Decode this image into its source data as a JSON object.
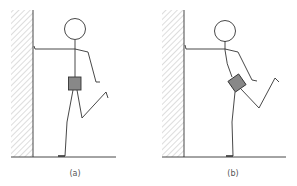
{
  "figure": {
    "panels": [
      {
        "id": "a",
        "label": "(a)",
        "description": "Stick figure leaning on wall with one leg raised; pelvis box upright"
      },
      {
        "id": "b",
        "label": "(b)",
        "description": "Stick figure leaning on wall with one leg raised; pelvis box tilted"
      }
    ]
  },
  "colors": {
    "line": "#333333",
    "hatch": "#999999",
    "pelvis_fill": "#888888"
  }
}
